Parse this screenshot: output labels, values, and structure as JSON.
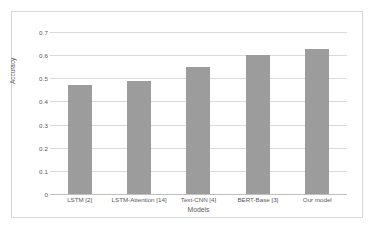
{
  "chart_data": {
    "type": "bar",
    "title": "",
    "xlabel": "Models",
    "ylabel": "Accuracy",
    "categories": [
      "LSTM [2]",
      "LSTM-Attention [14]",
      "Text-CNN [4]",
      "BERT-Base [3]",
      "Our model"
    ],
    "values": [
      0.47,
      0.49,
      0.55,
      0.6,
      0.625
    ],
    "ylim": [
      0,
      0.7
    ],
    "y_ticks": [
      0,
      0.1,
      0.2,
      0.3,
      0.4,
      0.5,
      0.6,
      0.7
    ],
    "y_tick_labels": [
      "0",
      "0.1",
      "0.2",
      "0.3",
      "0.4",
      "0.5",
      "0.6",
      "0.7"
    ],
    "grid": true,
    "legend": "none",
    "bar_color": "#9c9c9c",
    "gridline_color": "#d9d9d9",
    "plot_background": "#ffffff"
  }
}
